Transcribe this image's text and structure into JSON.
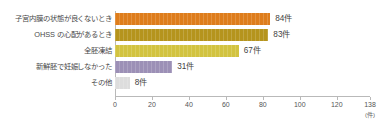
{
  "chart_data": {
    "type": "bar",
    "orientation": "horizontal",
    "title": "",
    "subtitle": "",
    "xlabel": "(件)",
    "ylabel": "",
    "categories": [
      "子宮内膜の状態が良くないとき",
      "OHSS の心配があるとき",
      "全胚凍結",
      "新鮮胚で妊娠しなかった",
      "その他"
    ],
    "values": [
      84,
      83,
      67,
      31,
      8
    ],
    "value_labels": [
      "84件",
      "83件",
      "67件",
      "31件",
      "8件"
    ],
    "colors": [
      "#DE7D1C",
      "#B5941D",
      "#D2C340",
      "#9C90B6",
      "#DDDDDD"
    ],
    "xlim": [
      0,
      138
    ],
    "xticks": [
      0,
      20,
      40,
      60,
      80,
      100,
      120,
      138
    ],
    "xtick_labels": [
      "0",
      "20",
      "40",
      "60",
      "80",
      "100",
      "120",
      "138"
    ],
    "grid": false,
    "legend": false,
    "unit": "件",
    "axis_color": "#b9b9b9"
  }
}
